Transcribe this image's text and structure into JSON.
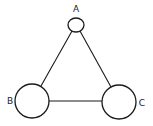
{
  "diagram": {
    "type": "graph",
    "nodes": [
      {
        "id": "A",
        "label": "A",
        "cx": 76,
        "cy": 25,
        "rx": 8,
        "ry": 7,
        "label_x": 76,
        "label_y": 12
      },
      {
        "id": "B",
        "label": "B",
        "cx": 32,
        "cy": 101,
        "rx": 17,
        "ry": 17,
        "label_x": 10,
        "label_y": 104
      },
      {
        "id": "C",
        "label": "C",
        "cx": 119,
        "cy": 102,
        "rx": 17,
        "ry": 17,
        "label_x": 142,
        "label_y": 106
      }
    ],
    "edges": [
      {
        "from": "A",
        "to": "B"
      },
      {
        "from": "A",
        "to": "C"
      },
      {
        "from": "B",
        "to": "C"
      }
    ],
    "colors": {
      "stroke": "#1a1a1a",
      "fill": "#ffffff",
      "background": "#ffffff"
    }
  }
}
